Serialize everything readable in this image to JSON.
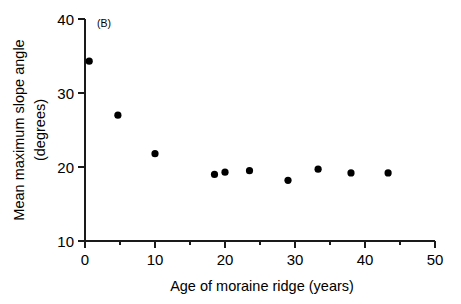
{
  "chart_data": {
    "type": "scatter",
    "title": "",
    "panel_label": "(B)",
    "xlabel": "Age of moraine ridge (years)",
    "ylabel": "Mean maximum slope angle (degrees)",
    "ylabel_line1": "Mean maximum slope angle",
    "ylabel_line2": "(degrees)",
    "xlim": [
      0,
      50
    ],
    "ylim": [
      10,
      40
    ],
    "xticks": [
      0,
      10,
      20,
      30,
      40,
      50
    ],
    "xtick_labels": [
      "0",
      "10",
      "20",
      "30",
      "40",
      "50"
    ],
    "xticks_minor": [
      5,
      15,
      25,
      35,
      45
    ],
    "yticks": [
      10,
      20,
      30,
      40
    ],
    "ytick_labels": [
      "10",
      "20",
      "30",
      "40"
    ],
    "grid": false,
    "legend": "none",
    "marker": "filled-circle",
    "marker_color": "#000000",
    "series": [
      {
        "name": "Mean maximum slope angle",
        "points": [
          {
            "x": 0.6,
            "y": 34.3
          },
          {
            "x": 4.7,
            "y": 27.0
          },
          {
            "x": 10.0,
            "y": 21.8
          },
          {
            "x": 18.5,
            "y": 19.0
          },
          {
            "x": 20.0,
            "y": 19.3
          },
          {
            "x": 23.5,
            "y": 19.5
          },
          {
            "x": 29.0,
            "y": 18.2
          },
          {
            "x": 33.3,
            "y": 19.7
          },
          {
            "x": 38.0,
            "y": 19.2
          },
          {
            "x": 43.3,
            "y": 19.2
          }
        ]
      }
    ]
  },
  "figure": {
    "background_color": "#ffffff",
    "axis_color": "#1a1a1a"
  }
}
